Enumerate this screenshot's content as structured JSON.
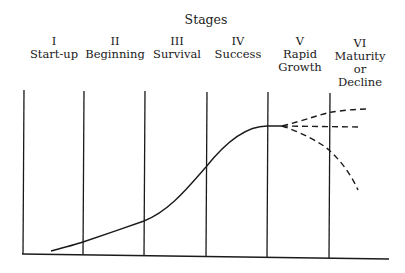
{
  "title": "Stages",
  "stages": [
    {
      "numeral": "I",
      "lines": [
        "Start-up"
      ],
      "cx": 54
    },
    {
      "numeral": "II",
      "lines": [
        "Beginning"
      ],
      "cx": 115
    },
    {
      "numeral": "III",
      "lines": [
        "Survival"
      ],
      "cx": 177
    },
    {
      "numeral": "IV",
      "lines": [
        "Success"
      ],
      "cx": 238
    },
    {
      "numeral": "V",
      "lines": [
        "Rapid",
        "Growth"
      ],
      "cx": 300
    },
    {
      "numeral": "VI",
      "lines": [
        "Maturity",
        "or",
        "Decline"
      ],
      "cx": 360
    }
  ],
  "dividers_x": [
    23,
    83,
    145,
    206,
    267,
    329
  ],
  "colors": {
    "line": "#1a1a1a",
    "background": "#ffffff"
  }
}
